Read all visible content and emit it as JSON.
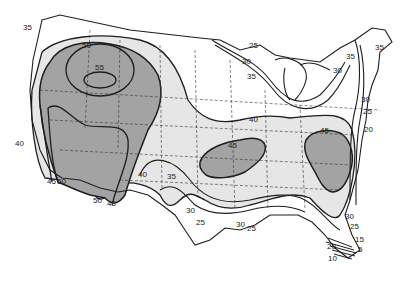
{
  "map": {
    "type": "contour-map",
    "region": "Contiguous United States",
    "colors": {
      "background": "#ffffff",
      "band_light": "#e6e6e6",
      "band_dark": "#a3a3a3",
      "line": "#1e1e1e",
      "state_line": "#333333"
    },
    "contour_values": [
      5,
      10,
      15,
      20,
      25,
      30,
      35,
      40,
      45,
      50,
      55
    ],
    "labels": [
      {
        "text": "35",
        "x": 28,
        "y": 28
      },
      {
        "text": "50",
        "x": 87,
        "y": 46
      },
      {
        "text": "55",
        "x": 100,
        "y": 68
      },
      {
        "text": "40",
        "x": 20,
        "y": 144
      },
      {
        "text": "45",
        "x": 52,
        "y": 182
      },
      {
        "text": "50",
        "x": 62,
        "y": 182
      },
      {
        "text": "50",
        "x": 98,
        "y": 201
      },
      {
        "text": "45",
        "x": 112,
        "y": 204
      },
      {
        "text": "40",
        "x": 143,
        "y": 175
      },
      {
        "text": "35",
        "x": 172,
        "y": 177
      },
      {
        "text": "45",
        "x": 233,
        "y": 146
      },
      {
        "text": "40",
        "x": 254,
        "y": 120
      },
      {
        "text": "30",
        "x": 191,
        "y": 211
      },
      {
        "text": "25",
        "x": 201,
        "y": 223
      },
      {
        "text": "30",
        "x": 241,
        "y": 225
      },
      {
        "text": "25",
        "x": 252,
        "y": 229
      },
      {
        "text": "25",
        "x": 254,
        "y": 46
      },
      {
        "text": "30",
        "x": 247,
        "y": 62
      },
      {
        "text": "35",
        "x": 252,
        "y": 77
      },
      {
        "text": "35",
        "x": 351,
        "y": 57
      },
      {
        "text": "30",
        "x": 338,
        "y": 71
      },
      {
        "text": "35",
        "x": 380,
        "y": 48
      },
      {
        "text": "30",
        "x": 366,
        "y": 100
      },
      {
        "text": "25",
        "x": 368,
        "y": 112
      },
      {
        "text": "20",
        "x": 369,
        "y": 130
      },
      {
        "text": "45",
        "x": 325,
        "y": 131
      },
      {
        "text": "30",
        "x": 350,
        "y": 217
      },
      {
        "text": "25",
        "x": 355,
        "y": 227
      },
      {
        "text": "15",
        "x": 360,
        "y": 240
      },
      {
        "text": "5",
        "x": 363,
        "y": 250
      },
      {
        "text": "20",
        "x": 332,
        "y": 247
      },
      {
        "text": "10",
        "x": 333,
        "y": 259
      }
    ]
  }
}
